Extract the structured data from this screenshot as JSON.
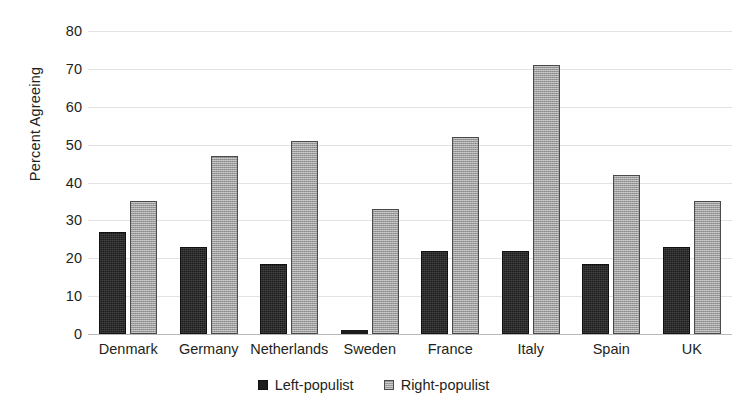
{
  "chart_data": {
    "type": "bar",
    "title": "",
    "xlabel": "",
    "ylabel": "Percent Agreeing",
    "ylim": [
      0,
      80
    ],
    "ytick_step": 10,
    "yticks": [
      "80",
      "70",
      "60",
      "50",
      "40",
      "30",
      "20",
      "10",
      "0"
    ],
    "grid": true,
    "legend_position": "bottom",
    "categories": [
      "Denmark",
      "Germany",
      "Netherlands",
      "Sweden",
      "France",
      "Italy",
      "Spain",
      "UK"
    ],
    "series": [
      {
        "name": "Left-populist",
        "color": "#1c1c1c",
        "values": [
          27,
          23,
          18.5,
          1,
          22,
          22,
          18.5,
          23
        ]
      },
      {
        "name": "Right-populist",
        "color": "#9c9c9c",
        "values": [
          35,
          47,
          51,
          33,
          52,
          71,
          42,
          35
        ]
      }
    ]
  }
}
